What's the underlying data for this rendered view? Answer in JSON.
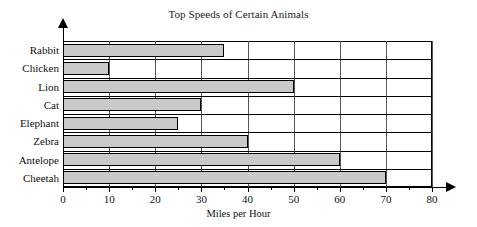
{
  "chart_data": {
    "type": "bar",
    "orientation": "horizontal",
    "title": "Top Speeds of Certain Animals",
    "xlabel": "Miles per Hour",
    "ylabel": "",
    "categories": [
      "Rabbit",
      "Chicken",
      "Lion",
      "Cat",
      "Elephant",
      "Zebra",
      "Antelope",
      "Cheetah"
    ],
    "values": [
      35,
      10,
      50,
      30,
      25,
      40,
      60,
      70
    ],
    "xlim": [
      0,
      80
    ],
    "xticks": [
      0,
      10,
      20,
      30,
      40,
      50,
      60,
      70,
      80
    ],
    "xtick_labels": [
      "0",
      "10",
      "20",
      "30",
      "40",
      "50",
      "60",
      "70",
      "80"
    ],
    "minor_xticks": [
      5,
      15,
      25,
      35,
      45,
      55,
      65,
      75
    ],
    "grid": "vertical",
    "legend": "none",
    "bar_fill_color": "#c9c9c9",
    "bar_edge_color": "#000000",
    "axis_color": "#000000",
    "gridline_color": "#555555",
    "background_color": "#ffffff"
  }
}
